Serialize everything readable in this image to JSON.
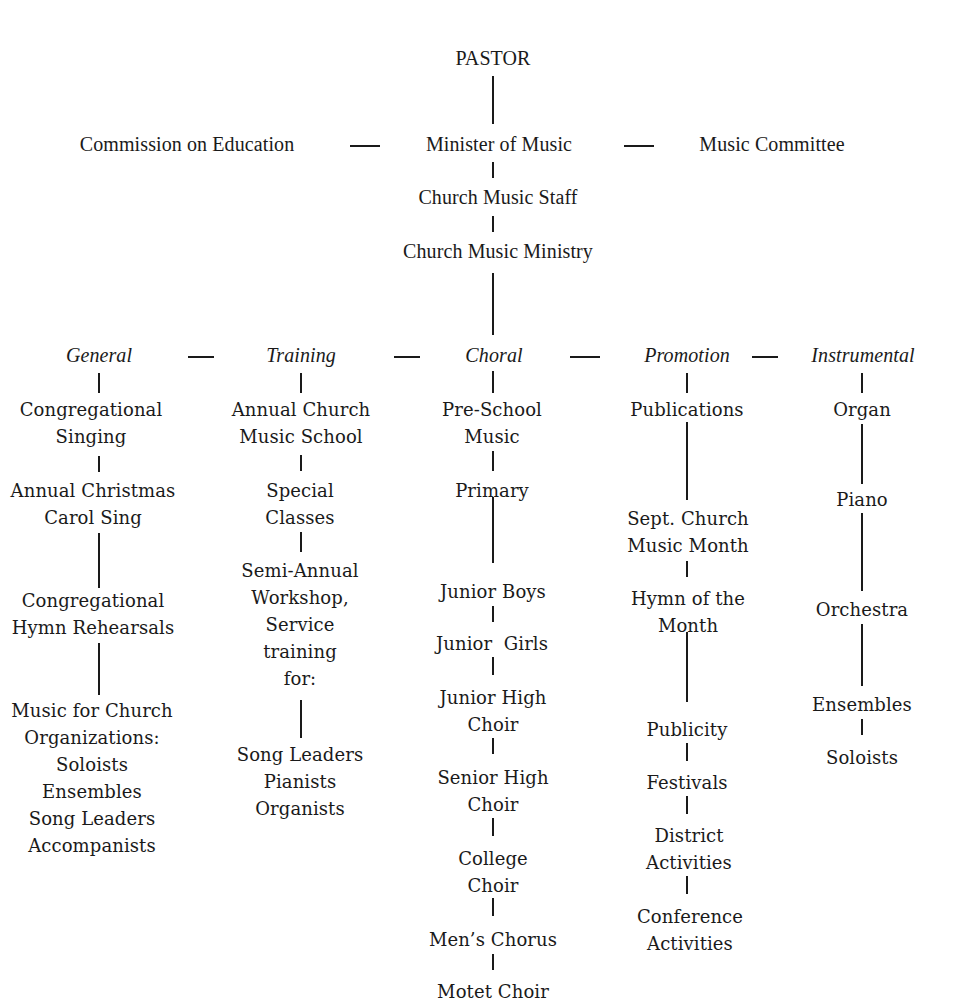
{
  "title": "PASTOR",
  "level1": {
    "left": "Commission on Education",
    "center": "Minister of Music",
    "right": "Music Committee"
  },
  "staff": "Church Music Staff",
  "ministry": "Church Music Ministry",
  "divisions": [
    {
      "name": "General",
      "items": [
        "Congregational\nSinging",
        "Annual Christmas\nCarol Sing",
        "Congregational\nHymn Rehearsals",
        "Music for Church\nOrganizations:\nSoloists\nEnsembles\nSong Leaders\nAccompanists"
      ]
    },
    {
      "name": "Training",
      "items": [
        "Annual Church\nMusic School",
        "Special\nClasses",
        "Semi-Annual\nWorkshop,\nService\ntraining\nfor:",
        "Song Leaders\nPianists\nOrganists"
      ]
    },
    {
      "name": "Choral",
      "items": [
        "Pre-School\nMusic",
        "Primary",
        "Junior Boys",
        "Junior  Girls",
        "Junior High\nChoir",
        "Senior High\nChoir",
        "College\nChoir",
        "Men’s Chorus",
        "Motet Choir"
      ]
    },
    {
      "name": "Promotion",
      "items": [
        "Publications",
        "Sept. Church\nMusic Month",
        "Hymn of the\nMonth",
        "Publicity",
        "Festivals",
        "District\nActivities",
        "Conference\nActivities"
      ]
    },
    {
      "name": "Instrumental",
      "items": [
        "Organ",
        "Piano",
        "Orchestra",
        "Ensembles",
        "Soloists"
      ]
    }
  ]
}
